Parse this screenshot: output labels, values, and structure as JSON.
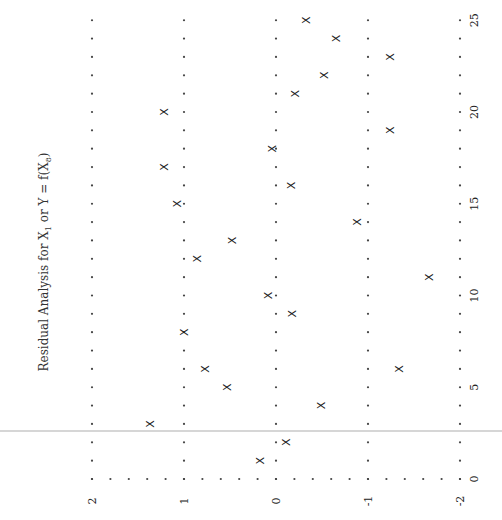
{
  "chart_data": {
    "type": "scatter",
    "title_parts": {
      "main": "Residual Analysis for ",
      "x": "X",
      "x_sub": "1",
      "or": " or ",
      "y": "Y",
      "eq": " = f(X",
      "sub": "8",
      "close": ")"
    },
    "orientation": "rotated-90-ccw",
    "xlabel": "",
    "ylabel": "",
    "x_ticks": [
      0,
      5,
      10,
      15,
      20,
      25
    ],
    "y_ticks": [
      2,
      1,
      0,
      -1,
      -2
    ],
    "y_tick_labels": [
      "2",
      "1",
      "0",
      "-1",
      "-2"
    ],
    "xlim": [
      0,
      25
    ],
    "ylim": [
      -2,
      2
    ],
    "grid": "dotted (0.2 residual steps at each integer residual, 1-unit steps along x)",
    "marker": "X",
    "series": [
      {
        "name": "residuals",
        "x": [
          1,
          2,
          3,
          4,
          5,
          6,
          6,
          8,
          9,
          10,
          11,
          12,
          13,
          14,
          15,
          16,
          17,
          18,
          19,
          20,
          21,
          22,
          23,
          24,
          25
        ],
        "y": [
          0.17,
          -0.11,
          1.36,
          -0.49,
          0.53,
          0.77,
          -1.34,
          1.0,
          -0.18,
          0.08,
          -1.67,
          0.85,
          0.47,
          -0.89,
          1.07,
          -0.17,
          1.21,
          0.04,
          -1.24,
          1.21,
          -0.21,
          -0.53,
          -1.24,
          -0.66,
          -0.33
        ]
      }
    ]
  },
  "layout": {
    "x0_px": 479,
    "px_per_x": 18.35,
    "y0_px": 276,
    "px_per_y": 92
  }
}
